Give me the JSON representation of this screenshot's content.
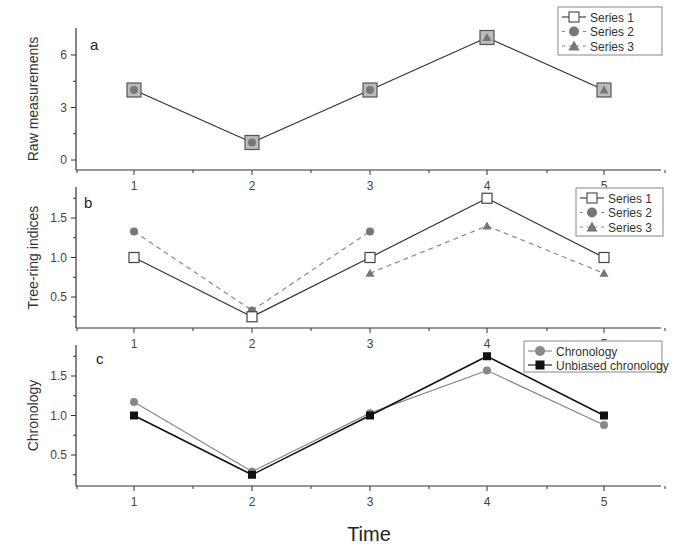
{
  "figure": {
    "xlabel": "Time",
    "panels": [
      {
        "id": "a",
        "ylabel": "Raw measurements",
        "yticks": [
          "0",
          "3",
          "6"
        ]
      },
      {
        "id": "b",
        "ylabel": "Tree-ring indices",
        "yticks": [
          "0.5",
          "1.0",
          "1.5"
        ]
      },
      {
        "id": "c",
        "ylabel": "Chronology",
        "yticks": [
          "0.5",
          "1.0",
          "1.5"
        ]
      }
    ],
    "xticks": [
      "1",
      "2",
      "3",
      "4",
      "5"
    ],
    "legend_a": [
      "Series 1",
      "Series 2",
      "Series 3"
    ],
    "legend_b": [
      "Series 1",
      "Series 2",
      "Series 3"
    ],
    "legend_c": [
      "Chronology",
      "Unbiased chronology"
    ]
  },
  "chart_data": [
    {
      "type": "line",
      "title": "a",
      "xlabel": "Time",
      "ylabel": "Raw measurements",
      "x": [
        1,
        2,
        3,
        4,
        5
      ],
      "ylim": [
        -0.5,
        7.5
      ],
      "series": [
        {
          "name": "Series 1",
          "marker": "open-square",
          "line": "solid",
          "values": [
            4,
            1,
            4,
            7,
            4
          ]
        },
        {
          "name": "Series 2",
          "marker": "filled-circle",
          "line": "dashed",
          "values": [
            4,
            1,
            4,
            7,
            4
          ]
        },
        {
          "name": "Series 3",
          "marker": "filled-triangle",
          "line": "dashed",
          "values": [
            4,
            1,
            4,
            7,
            4
          ]
        }
      ],
      "legend_position": "top-right"
    },
    {
      "type": "line",
      "title": "b",
      "xlabel": "Time",
      "ylabel": "Tree-ring indices",
      "x": [
        1,
        2,
        3,
        4,
        5
      ],
      "ylim": [
        0.1,
        1.9
      ],
      "series": [
        {
          "name": "Series 1",
          "marker": "open-square",
          "line": "solid",
          "values": [
            1.0,
            0.25,
            1.0,
            1.75,
            1.0
          ]
        },
        {
          "name": "Series 2",
          "marker": "filled-circle",
          "line": "dashed",
          "values": [
            1.33,
            0.33,
            1.33,
            null,
            null
          ]
        },
        {
          "name": "Series 3",
          "marker": "filled-triangle",
          "line": "dashed",
          "values": [
            null,
            null,
            0.8,
            1.4,
            0.8
          ]
        }
      ],
      "legend_position": "top-right"
    },
    {
      "type": "line",
      "title": "c",
      "xlabel": "Time",
      "ylabel": "Chronology",
      "x": [
        1,
        2,
        3,
        4,
        5
      ],
      "ylim": [
        0.1,
        1.9
      ],
      "series": [
        {
          "name": "Chronology",
          "marker": "filled-circle",
          "color": "#888888",
          "values": [
            1.17,
            0.29,
            1.03,
            1.57,
            0.88
          ]
        },
        {
          "name": "Unbiased chronology",
          "marker": "filled-square",
          "color": "#111111",
          "values": [
            1.0,
            0.25,
            1.0,
            1.75,
            1.0
          ]
        }
      ],
      "legend_position": "top-right"
    }
  ]
}
